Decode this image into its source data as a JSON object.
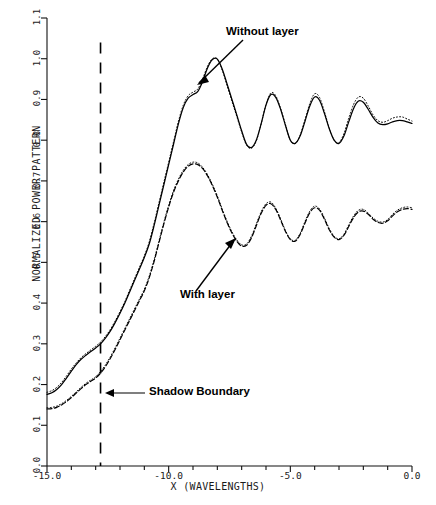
{
  "chart_data": {
    "type": "line",
    "title": "",
    "xlabel": "X (WAVELENGTHS)",
    "ylabel": "NORMALIZED POWER PATTERN",
    "xlim": [
      -15.0,
      0.0
    ],
    "ylim": [
      0.0,
      1.1
    ],
    "grid": false,
    "legend_position": "inline-annotations",
    "xticks": [
      "-15.0",
      "-10.0",
      "-5.0",
      "0.0"
    ],
    "xtick_values": [
      -15.0,
      -10.0,
      -5.0,
      0.0
    ],
    "yticks": [
      "0.0",
      "0.1",
      "0.2",
      "0.3",
      "0.4",
      "0.5",
      "0.6",
      "0.7",
      "0.8",
      "0.9",
      "1.0",
      "1.1"
    ],
    "ytick_values": [
      0.0,
      0.1,
      0.2,
      0.3,
      0.4,
      0.5,
      0.6,
      0.7,
      0.8,
      0.9,
      1.0,
      1.1
    ],
    "annotations": [
      {
        "name": "without-layer",
        "text": "Without layer",
        "x": -8.0,
        "y": 1.04
      },
      {
        "name": "with-layer",
        "text": "With layer",
        "x": -8.3,
        "y": 0.505
      },
      {
        "name": "shadow-boundary",
        "text": "Shadow Boundary",
        "x": -11.0,
        "y": 0.185
      }
    ],
    "vertical_lines": [
      {
        "name": "shadow-boundary-line",
        "x": -12.8,
        "style": "dashed",
        "y_from": 0.0,
        "y_to": 1.04
      }
    ],
    "series": [
      {
        "name": "Without layer",
        "style": "solid",
        "color": "#000000",
        "x": [
          -15.0,
          -14.8,
          -14.6,
          -14.4,
          -14.2,
          -14.0,
          -13.8,
          -13.6,
          -13.4,
          -13.2,
          -13.0,
          -12.8,
          -12.6,
          -12.4,
          -12.2,
          -12.0,
          -11.8,
          -11.6,
          -11.4,
          -11.2,
          -11.0,
          -10.8,
          -10.6,
          -10.4,
          -10.2,
          -10.0,
          -9.8,
          -9.6,
          -9.4,
          -9.2,
          -9.0,
          -8.8,
          -8.6,
          -8.4,
          -8.2,
          -8.0,
          -7.8,
          -7.6,
          -7.4,
          -7.2,
          -7.0,
          -6.8,
          -6.6,
          -6.4,
          -6.2,
          -6.0,
          -5.8,
          -5.6,
          -5.4,
          -5.2,
          -5.0,
          -4.8,
          -4.6,
          -4.4,
          -4.2,
          -4.0,
          -3.8,
          -3.6,
          -3.4,
          -3.2,
          -3.0,
          -2.8,
          -2.6,
          -2.4,
          -2.2,
          -2.0,
          -1.8,
          -1.6,
          -1.4,
          -1.2,
          -1.0,
          -0.8,
          -0.6,
          -0.4,
          -0.2,
          0.0
        ],
        "y": [
          0.176,
          0.18,
          0.188,
          0.2,
          0.216,
          0.233,
          0.249,
          0.262,
          0.272,
          0.281,
          0.29,
          0.3,
          0.314,
          0.331,
          0.352,
          0.375,
          0.4,
          0.428,
          0.456,
          0.484,
          0.512,
          0.545,
          0.59,
          0.64,
          0.69,
          0.74,
          0.79,
          0.84,
          0.88,
          0.903,
          0.912,
          0.92,
          0.945,
          0.978,
          0.998,
          0.999,
          0.975,
          0.938,
          0.9,
          0.862,
          0.823,
          0.79,
          0.782,
          0.8,
          0.84,
          0.886,
          0.912,
          0.905,
          0.876,
          0.836,
          0.8,
          0.792,
          0.81,
          0.846,
          0.884,
          0.906,
          0.898,
          0.866,
          0.828,
          0.8,
          0.792,
          0.81,
          0.845,
          0.878,
          0.896,
          0.893,
          0.876,
          0.856,
          0.842,
          0.838,
          0.84,
          0.845,
          0.848,
          0.848,
          0.845,
          0.841
        ]
      },
      {
        "name": "Without layer (dotted overlay)",
        "style": "dotted",
        "color": "#000000",
        "x": [
          -15.0,
          -14.8,
          -14.6,
          -14.4,
          -14.2,
          -14.0,
          -13.8,
          -13.6,
          -13.4,
          -13.2,
          -13.0,
          -12.8,
          -12.6,
          -12.4,
          -12.2,
          -12.0,
          -11.8,
          -11.6,
          -11.4,
          -11.2,
          -11.0,
          -10.8,
          -10.6,
          -10.4,
          -10.2,
          -10.0,
          -9.8,
          -9.6,
          -9.4,
          -9.2,
          -9.0,
          -8.8,
          -8.6,
          -8.4,
          -8.2,
          -8.0,
          -7.8,
          -7.6,
          -7.4,
          -7.2,
          -7.0,
          -6.8,
          -6.6,
          -6.4,
          -6.2,
          -6.0,
          -5.8,
          -5.6,
          -5.4,
          -5.2,
          -5.0,
          -4.8,
          -4.6,
          -4.4,
          -4.2,
          -4.0,
          -3.8,
          -3.6,
          -3.4,
          -3.2,
          -3.0,
          -2.8,
          -2.6,
          -2.4,
          -2.2,
          -2.0,
          -1.8,
          -1.6,
          -1.4,
          -1.2,
          -1.0,
          -0.8,
          -0.6,
          -0.4,
          -0.2,
          0.0
        ],
        "y": [
          0.181,
          0.185,
          0.193,
          0.205,
          0.221,
          0.238,
          0.253,
          0.266,
          0.276,
          0.285,
          0.294,
          0.304,
          0.318,
          0.335,
          0.356,
          0.379,
          0.404,
          0.432,
          0.46,
          0.488,
          0.516,
          0.55,
          0.596,
          0.646,
          0.696,
          0.746,
          0.796,
          0.846,
          0.886,
          0.909,
          0.918,
          0.926,
          0.951,
          0.982,
          1.0,
          0.999,
          0.972,
          0.934,
          0.896,
          0.858,
          0.82,
          0.788,
          0.78,
          0.798,
          0.84,
          0.888,
          0.916,
          0.909,
          0.878,
          0.838,
          0.8,
          0.792,
          0.812,
          0.85,
          0.89,
          0.914,
          0.905,
          0.87,
          0.83,
          0.8,
          0.794,
          0.816,
          0.854,
          0.888,
          0.906,
          0.903,
          0.884,
          0.862,
          0.848,
          0.844,
          0.848,
          0.854,
          0.857,
          0.857,
          0.852,
          0.847
        ]
      },
      {
        "name": "With layer",
        "style": "dashed",
        "color": "#000000",
        "x": [
          -15.0,
          -14.8,
          -14.6,
          -14.4,
          -14.2,
          -14.0,
          -13.8,
          -13.6,
          -13.4,
          -13.2,
          -13.0,
          -12.8,
          -12.6,
          -12.4,
          -12.2,
          -12.0,
          -11.8,
          -11.6,
          -11.4,
          -11.2,
          -11.0,
          -10.8,
          -10.6,
          -10.4,
          -10.2,
          -10.0,
          -9.8,
          -9.6,
          -9.4,
          -9.2,
          -9.0,
          -8.8,
          -8.6,
          -8.4,
          -8.2,
          -8.0,
          -7.8,
          -7.6,
          -7.4,
          -7.2,
          -7.0,
          -6.8,
          -6.6,
          -6.4,
          -6.2,
          -6.0,
          -5.8,
          -5.6,
          -5.4,
          -5.2,
          -5.0,
          -4.8,
          -4.6,
          -4.4,
          -4.2,
          -4.0,
          -3.8,
          -3.6,
          -3.4,
          -3.2,
          -3.0,
          -2.8,
          -2.6,
          -2.4,
          -2.2,
          -2.0,
          -1.8,
          -1.6,
          -1.4,
          -1.2,
          -1.0,
          -0.8,
          -0.6,
          -0.4,
          -0.2,
          0.0
        ],
        "y": [
          0.14,
          0.141,
          0.144,
          0.15,
          0.158,
          0.168,
          0.179,
          0.19,
          0.2,
          0.208,
          0.216,
          0.228,
          0.244,
          0.264,
          0.286,
          0.31,
          0.334,
          0.358,
          0.382,
          0.406,
          0.43,
          0.462,
          0.502,
          0.548,
          0.594,
          0.636,
          0.672,
          0.7,
          0.722,
          0.736,
          0.742,
          0.74,
          0.73,
          0.712,
          0.688,
          0.66,
          0.628,
          0.598,
          0.572,
          0.552,
          0.54,
          0.542,
          0.56,
          0.59,
          0.62,
          0.64,
          0.644,
          0.63,
          0.604,
          0.576,
          0.556,
          0.552,
          0.568,
          0.596,
          0.622,
          0.634,
          0.628,
          0.606,
          0.58,
          0.562,
          0.556,
          0.566,
          0.588,
          0.61,
          0.624,
          0.626,
          0.618,
          0.606,
          0.598,
          0.596,
          0.602,
          0.614,
          0.624,
          0.63,
          0.632,
          0.63
        ]
      },
      {
        "name": "With layer (dotted overlay)",
        "style": "dotted",
        "color": "#000000",
        "x": [
          -15.0,
          -14.8,
          -14.6,
          -14.4,
          -14.2,
          -14.0,
          -13.8,
          -13.6,
          -13.4,
          -13.2,
          -13.0,
          -12.8,
          -12.6,
          -12.4,
          -12.2,
          -12.0,
          -11.8,
          -11.6,
          -11.4,
          -11.2,
          -11.0,
          -10.8,
          -10.6,
          -10.4,
          -10.2,
          -10.0,
          -9.8,
          -9.6,
          -9.4,
          -9.2,
          -9.0,
          -8.8,
          -8.6,
          -8.4,
          -8.2,
          -8.0,
          -7.8,
          -7.6,
          -7.4,
          -7.2,
          -7.0,
          -6.8,
          -6.6,
          -6.4,
          -6.2,
          -6.0,
          -5.8,
          -5.6,
          -5.4,
          -5.2,
          -5.0,
          -4.8,
          -4.6,
          -4.4,
          -4.2,
          -4.0,
          -3.8,
          -3.6,
          -3.4,
          -3.2,
          -3.0,
          -2.8,
          -2.6,
          -2.4,
          -2.2,
          -2.0,
          -1.8,
          -1.6,
          -1.4,
          -1.2,
          -1.0,
          -0.8,
          -0.6,
          -0.4,
          -0.2,
          0.0
        ],
        "y": [
          0.143,
          0.144,
          0.147,
          0.153,
          0.161,
          0.171,
          0.182,
          0.193,
          0.203,
          0.211,
          0.219,
          0.232,
          0.248,
          0.268,
          0.29,
          0.314,
          0.338,
          0.362,
          0.386,
          0.41,
          0.434,
          0.466,
          0.506,
          0.552,
          0.598,
          0.64,
          0.676,
          0.704,
          0.726,
          0.74,
          0.746,
          0.744,
          0.733,
          0.715,
          0.691,
          0.663,
          0.631,
          0.601,
          0.575,
          0.555,
          0.543,
          0.545,
          0.564,
          0.594,
          0.624,
          0.644,
          0.648,
          0.633,
          0.607,
          0.578,
          0.558,
          0.554,
          0.571,
          0.6,
          0.626,
          0.638,
          0.631,
          0.609,
          0.583,
          0.564,
          0.558,
          0.569,
          0.592,
          0.614,
          0.628,
          0.63,
          0.621,
          0.609,
          0.601,
          0.599,
          0.605,
          0.618,
          0.628,
          0.634,
          0.636,
          0.634
        ]
      }
    ]
  },
  "axes": {
    "ylabel_text": "NORMALIZED POWER PATTERN",
    "xlabel_text": "X (WAVELENGTHS)"
  }
}
